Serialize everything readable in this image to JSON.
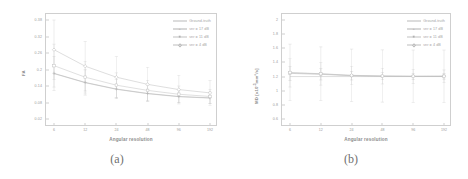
{
  "figure": {
    "panels": [
      {
        "caption": "(a)",
        "xlabel": "Angular resolution",
        "ylabel": "FA"
      },
      {
        "caption": "(b)",
        "xlabel": "Angular resolution",
        "ylabel_main": "MD [x10",
        "ylabel_exp": "-3",
        "ylabel_tail": "mm²/s]"
      }
    ],
    "legend": {
      "items": [
        {
          "label": "Ground-truth",
          "color": "#b9b9b9",
          "marker": "none"
        },
        {
          "label": "snr = 17 dB",
          "color": "#b2b2b2",
          "marker": "cross"
        },
        {
          "label": "snr = 11 dB",
          "color": "#c2c2c2",
          "marker": "square"
        },
        {
          "label": "snr = 4 dB",
          "color": "#bdbdbd",
          "marker": "diamond"
        }
      ]
    }
  },
  "chart_data": [
    {
      "type": "line",
      "title": "(a)",
      "xlabel": "Angular resolution",
      "ylabel": "FA",
      "categories": [
        6,
        12,
        24,
        48,
        96,
        192
      ],
      "xticklabels": [
        "6",
        "12",
        "24",
        "48",
        "96",
        "192"
      ],
      "xscale": "log2-index",
      "yticklabels": [
        "0.02",
        "0.08",
        "0.14",
        "0.2",
        "0.26",
        "0.32",
        "0.38"
      ],
      "ytickvalues": [
        0.02,
        0.08,
        0.14,
        0.2,
        0.26,
        0.32,
        0.38
      ],
      "ylim": [
        0.02,
        0.38
      ],
      "grid": false,
      "legend_position": "top-right",
      "series": [
        {
          "name": "Ground-truth",
          "color": "#bcbcbc",
          "marker": "none",
          "values": [
            0.185,
            0.152,
            0.128,
            0.112,
            0.101,
            0.096
          ],
          "errors": [
            0,
            0,
            0,
            0,
            0,
            0
          ]
        },
        {
          "name": "snr = 17 dB",
          "color": "#b2b2b2",
          "marker": "cross",
          "values": [
            0.186,
            0.153,
            0.129,
            0.113,
            0.102,
            0.097
          ],
          "errors": [
            0.062,
            0.046,
            0.035,
            0.028,
            0.023,
            0.021
          ]
        },
        {
          "name": "snr = 11 dB",
          "color": "#c2c2c2",
          "marker": "square",
          "values": [
            0.214,
            0.172,
            0.143,
            0.124,
            0.11,
            0.102
          ],
          "errors": [
            0.078,
            0.058,
            0.045,
            0.036,
            0.03,
            0.026
          ]
        },
        {
          "name": "snr = 4 dB",
          "color": "#bdbdbd",
          "marker": "diamond",
          "values": [
            0.272,
            0.212,
            0.172,
            0.146,
            0.127,
            0.115
          ],
          "errors": [
            0.108,
            0.09,
            0.075,
            0.062,
            0.052,
            0.045
          ]
        }
      ]
    },
    {
      "type": "line",
      "title": "(b)",
      "xlabel": "Angular resolution",
      "ylabel": "MD [x10-3mm2/s]",
      "categories": [
        6,
        12,
        24,
        48,
        96,
        192
      ],
      "xticklabels": [
        "6",
        "12",
        "24",
        "48",
        "96",
        "192"
      ],
      "xscale": "log2-index",
      "yticklabels": [
        "0.6",
        "0.8",
        "1",
        "1.2",
        "1.4",
        "1.6",
        "1.8",
        "2"
      ],
      "ytickvalues": [
        0.6,
        0.8,
        1.0,
        1.2,
        1.4,
        1.6,
        1.8,
        2.0
      ],
      "ylim": [
        0.6,
        2.0
      ],
      "grid": false,
      "legend_position": "top-right",
      "series": [
        {
          "name": "Ground-truth",
          "color": "#bcbcbc",
          "marker": "none",
          "values": [
            1.2,
            1.2,
            1.2,
            1.2,
            1.2,
            1.2
          ],
          "errors": [
            0,
            0,
            0,
            0,
            0,
            0
          ]
        },
        {
          "name": "snr = 17 dB",
          "color": "#b2b2b2",
          "marker": "cross",
          "values": [
            1.245,
            1.232,
            1.212,
            1.205,
            1.202,
            1.203
          ],
          "errors": [
            0.1,
            0.08,
            0.06,
            0.05,
            0.045,
            0.04
          ]
        },
        {
          "name": "snr = 11 dB",
          "color": "#c2c2c2",
          "marker": "square",
          "values": [
            1.252,
            1.238,
            1.215,
            1.206,
            1.203,
            1.204
          ],
          "errors": [
            0.2,
            0.16,
            0.13,
            0.11,
            0.1,
            0.09
          ]
        },
        {
          "name": "snr = 4 dB",
          "color": "#bdbdbd",
          "marker": "diamond",
          "values": [
            1.258,
            1.24,
            1.218,
            1.208,
            1.205,
            1.205
          ],
          "errors": [
            0.4,
            0.38,
            0.37,
            0.37,
            0.37,
            0.37
          ]
        }
      ]
    }
  ]
}
